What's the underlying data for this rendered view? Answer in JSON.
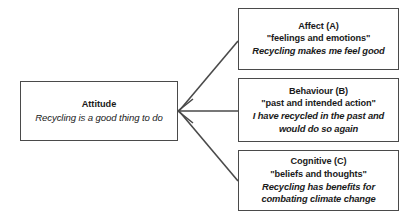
{
  "diagram": {
    "line_color": "#4a4a4a",
    "box_border_color": "#4a4a4a",
    "text_color": "#1a1a1a",
    "background": "#ffffff"
  },
  "source_node": {
    "title": "Attitude",
    "example": "Recycling is a good thing to do"
  },
  "components": [
    {
      "title": "Affect (A)",
      "definition": "\"feelings and emotions\"",
      "example_line_1": "Recycling makes me feel good",
      "example_line_2": ""
    },
    {
      "title": "Behaviour (B)",
      "definition": "\"past and intended action\"",
      "example_line_1": "I have recycled in the past and",
      "example_line_2": "would do so again"
    },
    {
      "title": "Cognitive (C)",
      "definition": "\"beliefs and thoughts\"",
      "example_line_1": "Recycling has benefits for",
      "example_line_2": "combating climate change"
    }
  ]
}
